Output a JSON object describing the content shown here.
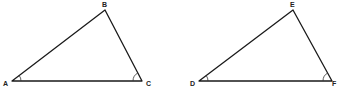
{
  "diagram": {
    "type": "geometry",
    "line_color": "#1a1a1a",
    "background": "#ffffff",
    "triangles": [
      {
        "name": "ABC",
        "vertices": [
          {
            "label": "A",
            "x": 12,
            "y": 81,
            "label_x": 3,
            "label_y": 86
          },
          {
            "label": "B",
            "x": 105,
            "y": 10,
            "label_x": 102,
            "label_y": 7
          },
          {
            "label": "C",
            "x": 142,
            "y": 81,
            "label_x": 146,
            "label_y": 86
          }
        ],
        "angle_marks": [
          {
            "at": "A",
            "count": 1
          },
          {
            "at": "C",
            "count": 1
          }
        ]
      },
      {
        "name": "DEF",
        "vertices": [
          {
            "label": "D",
            "x": 199,
            "y": 81,
            "label_x": 190,
            "label_y": 86
          },
          {
            "label": "E",
            "x": 293,
            "y": 10,
            "label_x": 290,
            "label_y": 7
          },
          {
            "label": "F",
            "x": 332,
            "y": 81,
            "label_x": 332,
            "label_y": 86
          }
        ],
        "angle_marks": [
          {
            "at": "D",
            "count": 1
          },
          {
            "at": "F",
            "count": 1
          }
        ]
      }
    ],
    "labels": {
      "A": "A",
      "B": "B",
      "C": "C",
      "D": "D",
      "E": "E",
      "F": "F"
    }
  }
}
